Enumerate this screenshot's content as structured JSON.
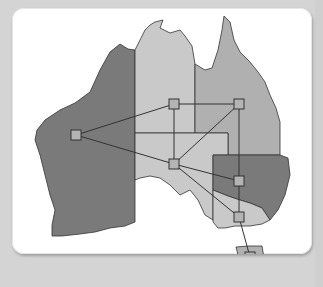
{
  "figure": {
    "caption": "Map of Australia with state graph"
  },
  "colors": {
    "background": "#d4d4d4",
    "card": "#ffffff",
    "dark_region": "#7a7a7a",
    "mid_region": "#b0b0b0",
    "light_region": "#c9c9c9",
    "node_fill": "#b4b4b4",
    "edge": "#333333"
  },
  "regions": [
    {
      "id": "WA",
      "label": "Western Australia",
      "shade": "dark"
    },
    {
      "id": "NT",
      "label": "Northern Territory",
      "shade": "light"
    },
    {
      "id": "QLD",
      "label": "Queensland",
      "shade": "mid"
    },
    {
      "id": "SA",
      "label": "South Australia",
      "shade": "light"
    },
    {
      "id": "NSW",
      "label": "New South Wales",
      "shade": "dark"
    },
    {
      "id": "VIC",
      "label": "Victoria",
      "shade": "light"
    },
    {
      "id": "TAS",
      "label": "Tasmania",
      "shade": "mid"
    }
  ],
  "nodes": [
    {
      "id": "WA",
      "x": 76,
      "y": 135
    },
    {
      "id": "NT",
      "x": 174,
      "y": 104
    },
    {
      "id": "QLD",
      "x": 239,
      "y": 104
    },
    {
      "id": "SA",
      "x": 174,
      "y": 164
    },
    {
      "id": "NSW",
      "x": 239,
      "y": 181
    },
    {
      "id": "VIC",
      "x": 239,
      "y": 217
    },
    {
      "id": "TAS",
      "x": 250,
      "y": 257
    }
  ],
  "edges": [
    [
      "WA",
      "NT"
    ],
    [
      "WA",
      "SA"
    ],
    [
      "NT",
      "QLD"
    ],
    [
      "NT",
      "SA"
    ],
    [
      "QLD",
      "SA"
    ],
    [
      "QLD",
      "NSW"
    ],
    [
      "SA",
      "NSW"
    ],
    [
      "SA",
      "VIC"
    ],
    [
      "NSW",
      "VIC"
    ],
    [
      "VIC",
      "TAS"
    ]
  ]
}
